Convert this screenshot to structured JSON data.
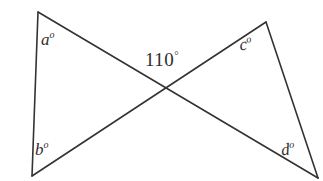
{
  "figure": {
    "kind": "vertical-angles-bowtie",
    "background_color": "#ffffff",
    "stroke_color": "#333333",
    "labels": {
      "a": {
        "text": "a",
        "degree": "o"
      },
      "b": {
        "text": "b",
        "degree": "o"
      },
      "c": {
        "text": "c",
        "degree": "o"
      },
      "d": {
        "text": "d",
        "degree": "o"
      },
      "known_angle": {
        "text": "110",
        "degree": "°"
      }
    }
  },
  "chart_data": {
    "type": "diagram",
    "title": "",
    "points": {
      "top_left": [
        38,
        12
      ],
      "bottom_left": [
        32,
        176
      ],
      "top_right": [
        266,
        22
      ],
      "bottom_right": [
        318,
        178
      ],
      "crossing": [
        167,
        89
      ]
    },
    "segments": [
      {
        "name": "left-vertical-side",
        "from": "top_left",
        "to": "bottom_left"
      },
      {
        "name": "right-vertical-side",
        "from": "top_right",
        "to": "bottom_right"
      },
      {
        "name": "diagonal-top-left-to-bottom-right",
        "from": "top_left",
        "to": "bottom_right"
      },
      {
        "name": "diagonal-bottom-left-to-top-right",
        "from": "bottom_left",
        "to": "top_right"
      }
    ],
    "angle_labels": [
      {
        "name": "a",
        "value": "a°",
        "at": [
          44,
          38
        ],
        "vertex": "top_left"
      },
      {
        "name": "b",
        "value": "b°",
        "at": [
          40,
          148
        ],
        "vertex": "bottom_left"
      },
      {
        "name": "c",
        "value": "c°",
        "at": [
          243,
          45
        ],
        "vertex": "top_right"
      },
      {
        "name": "d",
        "value": "d°",
        "at": [
          286,
          150
        ],
        "vertex": "bottom_right"
      },
      {
        "name": "known",
        "value": "110°",
        "at": [
          167,
          62
        ],
        "vertex": "crossing"
      }
    ],
    "axis": {
      "grid": false,
      "legend": false
    },
    "xlim": [
      0,
      323
    ],
    "ylim": [
      0,
      181
    ]
  }
}
